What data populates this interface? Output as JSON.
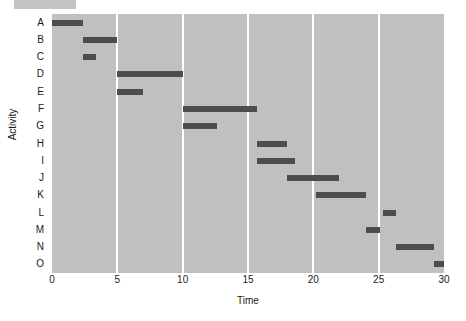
{
  "chart_data": {
    "type": "bar",
    "orientation": "horizontal-gantt",
    "title": "",
    "xlabel": "Time",
    "ylabel": "Activity",
    "xlim": [
      0,
      30
    ],
    "xticks": [
      0,
      5,
      10,
      15,
      20,
      25,
      30
    ],
    "xticklabels": [
      "0",
      "5",
      "10",
      "15",
      "20",
      "25",
      "30"
    ],
    "categories": [
      "A",
      "B",
      "C",
      "D",
      "E",
      "F",
      "G",
      "H",
      "I",
      "J",
      "K",
      "L",
      "M",
      "N",
      "O"
    ],
    "grid": "vertical-white-at-xticks",
    "legend": "none",
    "bar_color": "#4d4d4d",
    "plot_background": "#c0c0c0",
    "tasks": [
      {
        "activity": "A",
        "start": 0.0,
        "end": 2.4,
        "duration": 2.4
      },
      {
        "activity": "B",
        "start": 2.4,
        "end": 5.0,
        "duration": 2.6
      },
      {
        "activity": "C",
        "start": 2.4,
        "end": 3.4,
        "duration": 1.0
      },
      {
        "activity": "D",
        "start": 5.0,
        "end": 10.0,
        "duration": 5.0
      },
      {
        "activity": "E",
        "start": 5.0,
        "end": 7.0,
        "duration": 2.0
      },
      {
        "activity": "F",
        "start": 10.0,
        "end": 15.7,
        "duration": 5.7
      },
      {
        "activity": "G",
        "start": 10.0,
        "end": 12.6,
        "duration": 2.6
      },
      {
        "activity": "H",
        "start": 15.7,
        "end": 18.0,
        "duration": 2.3
      },
      {
        "activity": "I",
        "start": 15.7,
        "end": 18.6,
        "duration": 2.9
      },
      {
        "activity": "J",
        "start": 18.0,
        "end": 22.0,
        "duration": 4.0
      },
      {
        "activity": "K",
        "start": 20.2,
        "end": 24.0,
        "duration": 3.8
      },
      {
        "activity": "L",
        "start": 25.3,
        "end": 26.3,
        "duration": 1.0
      },
      {
        "activity": "M",
        "start": 24.0,
        "end": 25.1,
        "duration": 1.1
      },
      {
        "activity": "N",
        "start": 26.3,
        "end": 29.2,
        "duration": 2.9
      },
      {
        "activity": "O",
        "start": 29.2,
        "end": 30.0,
        "duration": 0.8
      }
    ]
  }
}
